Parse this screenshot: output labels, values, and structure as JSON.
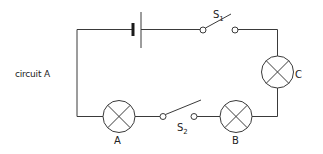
{
  "caption": "circuit A",
  "components": {
    "battery": {
      "label": ""
    },
    "switch_1": {
      "letter": "S",
      "subscript": "1",
      "state": "open"
    },
    "switch_2": {
      "letter": "S",
      "subscript": "2",
      "state": "open"
    },
    "lamp_a": {
      "label": "A"
    },
    "lamp_b": {
      "label": "B"
    },
    "lamp_c": {
      "label": "C"
    }
  },
  "colors": {
    "line": "#3a3a3a",
    "background": "#ffffff",
    "text": "#222222"
  }
}
